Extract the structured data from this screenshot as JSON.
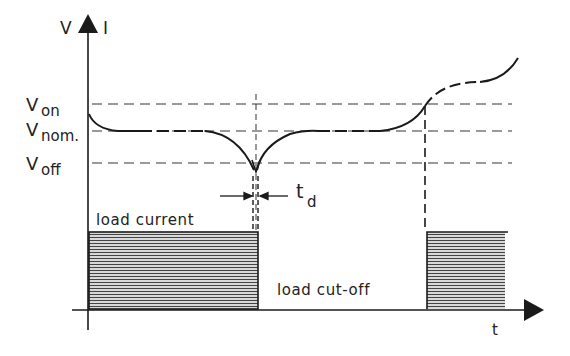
{
  "axes": {
    "y_label_left": "V",
    "y_label_right": "I",
    "x_label": "t"
  },
  "levels": {
    "von": {
      "main": "V",
      "sub": "on"
    },
    "vnom": {
      "main": "V",
      "sub": "nom."
    },
    "voff": {
      "main": "V",
      "sub": "off"
    }
  },
  "annotations": {
    "td_main": "t",
    "td_sub": "d",
    "load_current": "load current",
    "load_cutoff": "load cut-off"
  },
  "colors": {
    "ink": "#1a1a1a",
    "hatch": "#555555",
    "background": "#ffffff"
  }
}
